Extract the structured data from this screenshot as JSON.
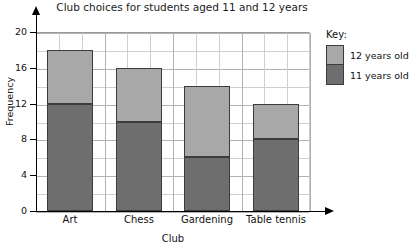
{
  "chart_data": {
    "type": "bar",
    "subtype": "stacked-bar",
    "title": "Club choices for students aged 11 and 12 years",
    "xlabel": "Club",
    "ylabel": "Frequency",
    "categories": [
      "Art",
      "Chess",
      "Gardening",
      "Table tennis"
    ],
    "series": [
      {
        "name": "11 years old",
        "color": "#6e6e6e",
        "values": [
          12,
          10,
          6,
          8
        ]
      },
      {
        "name": "12 years old",
        "color": "#a8a8a8",
        "values": [
          6,
          6,
          8,
          4
        ]
      }
    ],
    "totals": [
      18,
      16,
      14,
      12
    ],
    "ylim": [
      0,
      20
    ],
    "ytick_labels": [
      "0",
      "4",
      "8",
      "12",
      "16",
      "20"
    ],
    "ytick_values": [
      0,
      4,
      8,
      12,
      16,
      20
    ],
    "y_minor_step": 2,
    "grid": true,
    "legend_position": "right"
  },
  "legend": {
    "title": "Key:",
    "entries": [
      {
        "label": "12 years old",
        "color": "#a8a8a8"
      },
      {
        "label": "11 years old",
        "color": "#6e6e6e"
      }
    ]
  },
  "colors": {
    "series_11": "#6e6e6e",
    "series_12": "#a8a8a8",
    "grid_major": "#b2b2b2",
    "grid_minor": "#cfcfcf",
    "axis": "#000000",
    "bar_border": "#3c3c3c",
    "background": "#ffffff"
  }
}
